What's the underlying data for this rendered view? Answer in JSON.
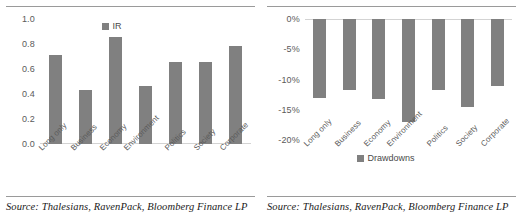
{
  "figure": {
    "panels": [
      {
        "id": "ir-panel",
        "source_note": "Source: Thalesians, RavenPack, Bloomberg Finance LP"
      },
      {
        "id": "drawdowns-panel",
        "source_note": "Source: Thalesians, RavenPack, Bloomberg Finance LP"
      }
    ],
    "bar_color": "#808080",
    "axis_color": "#d3d3d3",
    "rule_color": "#9a9a9a"
  },
  "chart_data": [
    {
      "type": "bar",
      "title": "",
      "xlabel": "",
      "ylabel": "",
      "legend": [
        "IR"
      ],
      "legend_position": "top-center",
      "grid": false,
      "categories": [
        "Long only",
        "Business",
        "Economy",
        "Environment",
        "Politics",
        "Society",
        "Corporate"
      ],
      "values": [
        0.71,
        0.435,
        0.855,
        0.465,
        0.655,
        0.655,
        0.785
      ],
      "ylim": [
        0.0,
        1.0
      ],
      "yticks": [
        "0.0",
        "0.2",
        "0.4",
        "0.6",
        "0.8",
        "1.0"
      ],
      "ytick_values": [
        0.0,
        0.2,
        0.4,
        0.6,
        0.8,
        1.0
      ]
    },
    {
      "type": "bar",
      "title": "",
      "xlabel": "",
      "ylabel": "",
      "legend": [
        "Drawdowns"
      ],
      "legend_position": "bottom-center",
      "grid": false,
      "categories": [
        "Long only",
        "Business",
        "Economy",
        "Environment",
        "Politics",
        "Society",
        "Corporate"
      ],
      "values": [
        -13.0,
        -11.8,
        -13.2,
        -17.0,
        -11.8,
        -14.5,
        -11.0
      ],
      "ylim": [
        -20.0,
        0.0
      ],
      "yticks": [
        "0%",
        "-5%",
        "-10%",
        "-15%",
        "-20%"
      ],
      "ytick_values": [
        0,
        -5,
        -10,
        -15,
        -20
      ]
    }
  ]
}
